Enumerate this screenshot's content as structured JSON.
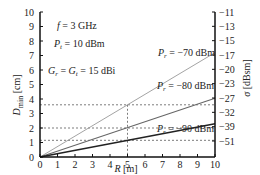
{
  "chart_data": {
    "type": "line",
    "title": "",
    "xlabel": "R [m]",
    "ylabel": "D_min [cm]",
    "y2label": "σ [dBsm]",
    "xlim": [
      0,
      10
    ],
    "ylim": [
      0,
      10
    ],
    "x_ticks": [
      "0",
      "1",
      "2",
      "3",
      "4",
      "5",
      "6",
      "7",
      "8",
      "9",
      "10"
    ],
    "y_ticks": [
      "0",
      "1",
      "2",
      "3",
      "4",
      "5",
      "6",
      "7",
      "8",
      "9",
      "10"
    ],
    "y2_ticks": [
      "-11",
      "-13",
      "-15",
      "-17",
      "-20",
      "-23",
      "-27",
      "-32",
      "-39",
      "-51"
    ],
    "annotations": {
      "freq": "f = 3 GHz",
      "pt": "P_t = 10 dBm",
      "gain": "G_r = G_t = 15 dBi"
    },
    "series": [
      {
        "name": "P_r = −70 dBm",
        "x": [
          0,
          10
        ],
        "y": [
          0,
          7.2
        ]
      },
      {
        "name": "P_r = −80 dBm",
        "x": [
          0,
          10
        ],
        "y": [
          0,
          4.05
        ]
      },
      {
        "name": "P_r = −90 dBm",
        "x": [
          0,
          10
        ],
        "y": [
          0,
          2.3
        ]
      }
    ],
    "reference_lines": {
      "vertical_x": 5,
      "horizontal_y": [
        3.6,
        2.0,
        1.15
      ]
    },
    "grid": false
  }
}
